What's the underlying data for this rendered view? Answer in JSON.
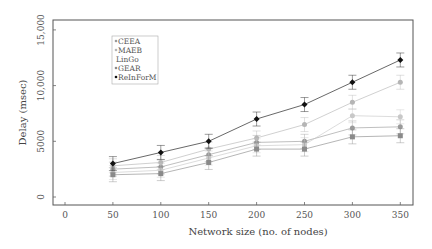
{
  "chart_data": {
    "type": "line",
    "title": "",
    "xlabel": "Network size (no. of nodes)",
    "ylabel": "Delay (msec)",
    "x": [
      50,
      100,
      150,
      200,
      250,
      300,
      350
    ],
    "xticks": [
      "0",
      "50",
      "100",
      "150",
      "200",
      "250",
      "300",
      "350"
    ],
    "xtick_values": [
      0,
      50,
      100,
      150,
      200,
      250,
      300,
      350
    ],
    "yticks": [
      "0",
      "5000",
      "10,000",
      "15,000"
    ],
    "ytick_values": [
      0,
      5000,
      10000,
      15000
    ],
    "xlim": [
      -15,
      365
    ],
    "ylim": [
      -500,
      16500
    ],
    "grid": false,
    "error_bars": true,
    "legend_position": "upper-left",
    "series": [
      {
        "name": "CEEA",
        "values": [
          2500,
          2700,
          3800,
          4900,
          5000,
          6200,
          6300
        ],
        "color": "#9a9a9a",
        "marker": "circle"
      },
      {
        "name": "MAEB",
        "values": [
          2800,
          3100,
          4300,
          5300,
          6500,
          8500,
          10300
        ],
        "color": "#b5b5b5",
        "marker": "circle"
      },
      {
        "name": "LinGo",
        "values": [
          2200,
          2400,
          3500,
          4600,
          4700,
          7300,
          7200
        ],
        "color": "#c8c8c8",
        "marker": "circle"
      },
      {
        "name": "GEAR",
        "values": [
          2000,
          2100,
          3100,
          4300,
          4300,
          5400,
          5500
        ],
        "color": "#8a8a8a",
        "marker": "square"
      },
      {
        "name": "ReInForM",
        "values": [
          3000,
          4000,
          5000,
          7000,
          8300,
          10300,
          12300
        ],
        "color": "#111111",
        "marker": "diamond"
      }
    ]
  }
}
